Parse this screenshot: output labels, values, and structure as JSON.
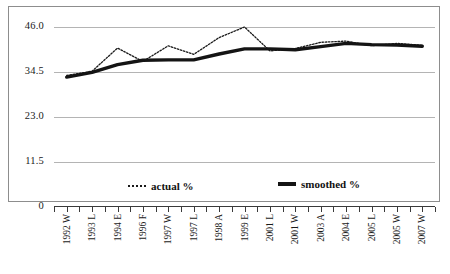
{
  "chart_data": {
    "type": "line",
    "title": "",
    "subtitle": "",
    "xlabel": "",
    "ylabel": "",
    "ylim": [
      0,
      46.0
    ],
    "y_ticks": [
      "0",
      "11.5",
      "23.0",
      "34.5",
      "46.0"
    ],
    "y_tick_values": [
      0,
      11.5,
      23.0,
      34.5,
      46.0
    ],
    "grid": true,
    "legend_position": "bottom-inside",
    "categories": [
      "1992 W",
      "1993 L",
      "1994 E",
      "1996 F",
      "1997 W",
      "1997 L",
      "1998 A",
      "1999 E",
      "2001 L",
      "2001 W",
      "2003 A",
      "2004 E",
      "2005 L",
      "2005 W",
      "2007 W"
    ],
    "series": [
      {
        "name": "actual %",
        "style": "dotted",
        "color": "#1a1a1a",
        "values": [
          33.6,
          34.7,
          40.6,
          37.2,
          41.2,
          39.0,
          43.3,
          46.0,
          39.9,
          40.5,
          42.1,
          42.4,
          41.2,
          41.8,
          41.3
        ]
      },
      {
        "name": "smoothed %",
        "style": "solid-thick",
        "color": "#141414",
        "values": [
          33.2,
          34.4,
          36.4,
          37.5,
          37.6,
          37.6,
          39.1,
          40.4,
          40.4,
          40.2,
          41.0,
          41.8,
          41.5,
          41.4,
          41.1
        ]
      }
    ],
    "legend": [
      {
        "label": "actual %",
        "marker": "dotted-line"
      },
      {
        "label": "smoothed %",
        "marker": "thick-solid-line"
      }
    ],
    "colors": {
      "grid": "#b4b4b4",
      "axis": "#3a3a3a",
      "frame": "#8d8d8d",
      "actual": "#1a1a1a",
      "smoothed": "#141414",
      "background": "#ffffff"
    },
    "minor_ticks_per_category": 2
  }
}
